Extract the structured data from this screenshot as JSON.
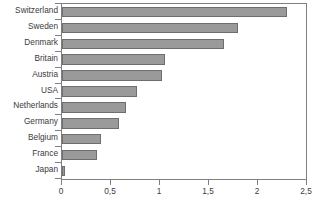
{
  "chart_data": {
    "type": "bar",
    "orientation": "horizontal",
    "title": "",
    "subtitle": "",
    "xlabel": "",
    "ylabel": "",
    "categories": [
      "Switzerland",
      "Sweden",
      "Denmark",
      "Britain",
      "Austria",
      "USA",
      "Netherlands",
      "Germany",
      "Belgium",
      "France",
      "Japan"
    ],
    "values": [
      2.3,
      1.8,
      1.65,
      1.05,
      1.02,
      0.77,
      0.65,
      0.58,
      0.4,
      0.36,
      0.03
    ],
    "series": [
      {
        "name": "",
        "values": [
          2.3,
          1.8,
          1.65,
          1.05,
          1.02,
          0.77,
          0.65,
          0.58,
          0.4,
          0.36,
          0.03
        ]
      }
    ],
    "xlim": [
      0,
      2.5
    ],
    "xticks": [
      0,
      0.5,
      1,
      1.5,
      2,
      2.5
    ],
    "xtick_labels": [
      "0",
      "0,5",
      "1",
      "1,5",
      "2",
      "2,5"
    ],
    "decimal_separator": ",",
    "grid": false,
    "legend": false,
    "legend_position": "none",
    "annotations": [],
    "colors": {
      "bar_fill": "#9a9a9a",
      "bar_border": "#6e6e6e",
      "axis": "#808080",
      "text": "#3b3b3b",
      "background": "#ffffff"
    }
  }
}
